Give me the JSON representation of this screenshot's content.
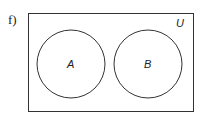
{
  "problem_label": "f)",
  "diagram": {
    "type": "venn",
    "universe_label": "U",
    "sets": [
      {
        "label": "A"
      },
      {
        "label": "B"
      }
    ],
    "relationship": "disjoint",
    "colors": {
      "stroke": "#333333",
      "background": "#ffffff"
    }
  }
}
